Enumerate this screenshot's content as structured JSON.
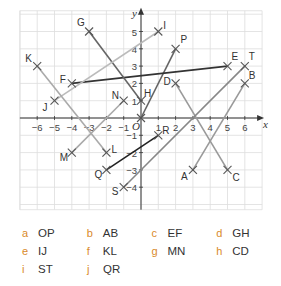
{
  "chart_data": {
    "type": "scatter",
    "title": "",
    "xlabel": "x",
    "ylabel": "y",
    "xlim": [
      -7,
      7
    ],
    "ylim": [
      -5.3,
      6.2
    ],
    "grid": true,
    "x_ticks": [
      -6,
      -5,
      -4,
      -3,
      -2,
      -1,
      1,
      2,
      3,
      4,
      5,
      6
    ],
    "y_ticks": [
      -4,
      -3,
      -2,
      -1,
      1,
      2,
      3,
      4,
      5
    ],
    "origin_label": "O",
    "points": [
      {
        "name": "A",
        "x": 3,
        "y": -3
      },
      {
        "name": "B",
        "x": 6,
        "y": 2
      },
      {
        "name": "C",
        "x": 5,
        "y": -3
      },
      {
        "name": "D",
        "x": 2,
        "y": 2
      },
      {
        "name": "E",
        "x": 5,
        "y": 3
      },
      {
        "name": "F",
        "x": -4,
        "y": 2
      },
      {
        "name": "G",
        "x": -3,
        "y": 5
      },
      {
        "name": "H",
        "x": 0,
        "y": 1
      },
      {
        "name": "I",
        "x": 1,
        "y": 5
      },
      {
        "name": "J",
        "x": -5,
        "y": 1
      },
      {
        "name": "K",
        "x": -6,
        "y": 3
      },
      {
        "name": "L",
        "x": -2,
        "y": -2
      },
      {
        "name": "M",
        "x": -4,
        "y": -2
      },
      {
        "name": "N",
        "x": -1,
        "y": 1
      },
      {
        "name": "O",
        "x": 0,
        "y": 0
      },
      {
        "name": "P",
        "x": 2,
        "y": 4
      },
      {
        "name": "Q",
        "x": -2,
        "y": -3
      },
      {
        "name": "R",
        "x": 1,
        "y": -1
      },
      {
        "name": "S",
        "x": -1,
        "y": -4
      },
      {
        "name": "T",
        "x": 6,
        "y": 3
      }
    ],
    "segments": [
      {
        "name": "OP",
        "from": "O",
        "to": "P",
        "color": "#666666"
      },
      {
        "name": "AB",
        "from": "A",
        "to": "B",
        "color": "#9a9a9a"
      },
      {
        "name": "EF",
        "from": "E",
        "to": "F",
        "color": "#333333"
      },
      {
        "name": "GH",
        "from": "G",
        "to": "H",
        "color": "#666666"
      },
      {
        "name": "IJ",
        "from": "I",
        "to": "J",
        "color": "#bbbbbb"
      },
      {
        "name": "KL",
        "from": "K",
        "to": "L",
        "color": "#aaaaaa"
      },
      {
        "name": "MN",
        "from": "M",
        "to": "N",
        "color": "#aaaaaa"
      },
      {
        "name": "CD",
        "from": "C",
        "to": "D",
        "color": "#9a9a9a"
      },
      {
        "name": "ST",
        "from": "S",
        "to": "T",
        "color": "#888888"
      },
      {
        "name": "QR",
        "from": "Q",
        "to": "R",
        "color": "#222222"
      }
    ]
  },
  "questions": [
    [
      {
        "letter": "a",
        "text": "OP"
      },
      {
        "letter": "b",
        "text": "AB"
      },
      {
        "letter": "c",
        "text": "EF"
      },
      {
        "letter": "d",
        "text": "GH"
      }
    ],
    [
      {
        "letter": "e",
        "text": "IJ"
      },
      {
        "letter": "f",
        "text": "KL"
      },
      {
        "letter": "g",
        "text": "MN"
      },
      {
        "letter": "h",
        "text": "CD"
      }
    ],
    [
      {
        "letter": "i",
        "text": "ST"
      },
      {
        "letter": "j",
        "text": "QR"
      }
    ]
  ],
  "colors": {
    "question_letter": "#d98a2b",
    "grid": "#dddddd",
    "axis": "#333333"
  }
}
